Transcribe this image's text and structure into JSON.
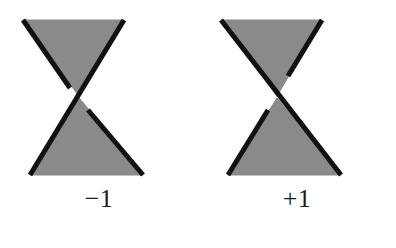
{
  "figure": {
    "background_color": "#ffffff",
    "fill_color": "#8a8a8a",
    "stroke_color": "#111111",
    "label_color": "#1a1a1a",
    "stroke_width": 5,
    "break_gap": 13,
    "geometry": {
      "top_left_x": 23,
      "top_right_x": 124,
      "bottom_left_x": 30,
      "bottom_right_x": 143,
      "top_y": 20,
      "bottom_y": 175,
      "center_x": 79,
      "center_y": 97
    },
    "crossings": [
      {
        "id": "negative-crossing",
        "label": "−1",
        "sign": -1,
        "over_strand": "NE-to-SW",
        "under_strand": "NW-to-SE",
        "description": "negative crossing"
      },
      {
        "id": "positive-crossing",
        "label": "+1",
        "sign": 1,
        "over_strand": "NW-to-SE",
        "under_strand": "NE-to-SW",
        "description": "positive crossing"
      }
    ]
  }
}
